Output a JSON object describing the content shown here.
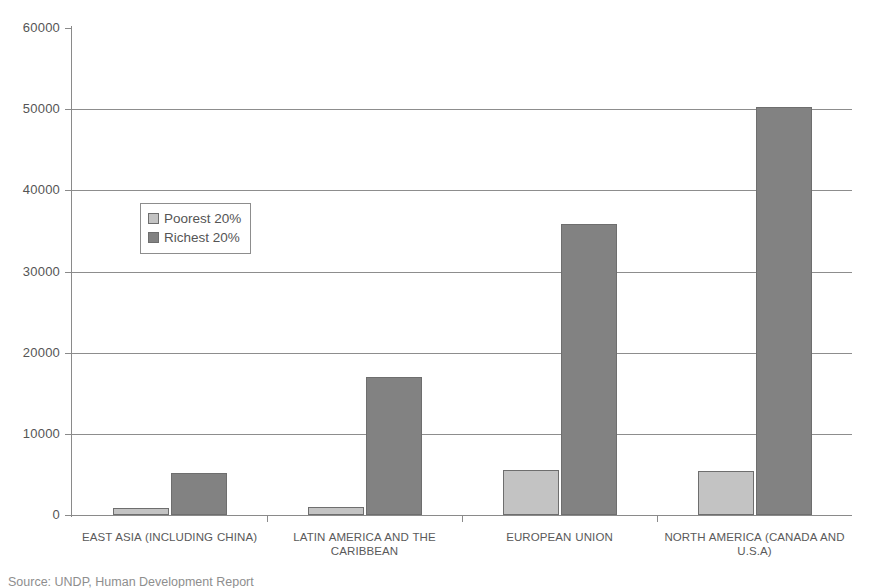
{
  "chart_data": {
    "type": "bar",
    "title": "",
    "subtitle": "",
    "xlabel": "",
    "ylabel": "",
    "ylim": [
      0,
      60000
    ],
    "yticks": [
      0,
      10000,
      20000,
      30000,
      40000,
      50000,
      60000
    ],
    "ytick_labels": [
      "0",
      "10000",
      "20000",
      "30000",
      "40000",
      "50000",
      "60000"
    ],
    "grid": "horizontal",
    "legend_position": "inside-upper-left",
    "categories": [
      "EAST ASIA (INCLUDING CHINA)",
      "LATIN AMERICA AND THE CARIBBEAN",
      "EUROPEAN UNION",
      "NORTH AMERICA (CANADA AND U.S.A)"
    ],
    "series": [
      {
        "name": "Poorest 20%",
        "color": "#c3c3c3",
        "values": [
          850,
          950,
          5500,
          5400
        ]
      },
      {
        "name": "Richest 20%",
        "color": "#828282",
        "values": [
          5200,
          17000,
          35800,
          50300
        ]
      }
    ],
    "annotations": []
  },
  "legend": {
    "entries": [
      {
        "label": "Poorest 20%",
        "swatch": "poorest"
      },
      {
        "label": "Richest 20%",
        "swatch": "richest"
      }
    ]
  },
  "caption": {
    "source_text": "Source: UNDP, Human Development Report"
  },
  "colors": {
    "poorest": "#c3c3c3",
    "richest": "#828282",
    "axis": "#8a8a8a",
    "grid": "#8d8d8d",
    "text": "#555555",
    "background": "#ffffff"
  }
}
